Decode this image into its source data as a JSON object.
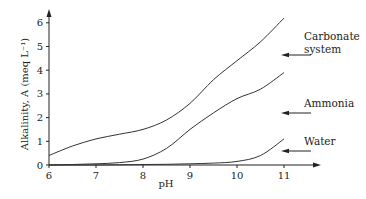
{
  "chart_data": {
    "type": "line",
    "title": "",
    "xlabel": "pH",
    "ylabel": "Alkalinity, A (meq L⁻¹)",
    "xlim": [
      6,
      11
    ],
    "ylim": [
      0,
      6.5
    ],
    "x_ticks": [
      "6",
      "7",
      "8",
      "9",
      "10",
      "11"
    ],
    "y_ticks": [
      "0",
      "1",
      "2",
      "3",
      "4",
      "5",
      "6"
    ],
    "grid": false,
    "legend": "inline labels with arrows at right",
    "series": [
      {
        "name": "Carbonate system",
        "label_lines": [
          "Carbonate",
          "system"
        ],
        "x": [
          6,
          6.5,
          7,
          7.5,
          8,
          8.5,
          9,
          9.5,
          10,
          10.5,
          11
        ],
        "values": [
          0.4,
          0.8,
          1.1,
          1.3,
          1.5,
          1.9,
          2.6,
          3.6,
          4.4,
          5.2,
          6.2
        ]
      },
      {
        "name": "Ammonia",
        "label_lines": [
          "Ammonia"
        ],
        "x": [
          6,
          6.5,
          7,
          7.5,
          8,
          8.5,
          9,
          9.5,
          10,
          10.5,
          11
        ],
        "values": [
          0.0,
          0.02,
          0.05,
          0.1,
          0.25,
          0.7,
          1.5,
          2.2,
          2.8,
          3.2,
          3.9
        ]
      },
      {
        "name": "Water",
        "label_lines": [
          "Water"
        ],
        "x": [
          6,
          6.5,
          7,
          7.5,
          8,
          8.5,
          9,
          9.5,
          10,
          10.5,
          11
        ],
        "values": [
          0.0,
          0.0,
          0.0,
          0.01,
          0.02,
          0.03,
          0.05,
          0.08,
          0.15,
          0.4,
          1.1
        ]
      }
    ]
  }
}
